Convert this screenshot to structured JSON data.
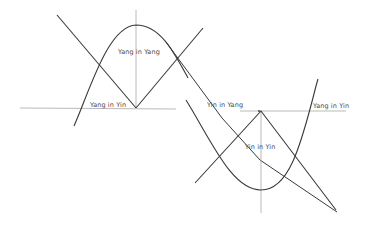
{
  "diagram": {
    "type": "hand-drawn-sketch",
    "background": "#ffffff",
    "stroke_color": "#3a3a3a",
    "axis_color": "#9a9a9a",
    "labels": {
      "yang_in_yang": "Yang in Yang",
      "yang_in_yin_left": "Yang in Yin",
      "yin_in_yang": "Yin in Yang",
      "yang_in_yin_right": "Yang in Yin",
      "yin_in_yin": "Yin in Yin"
    }
  }
}
